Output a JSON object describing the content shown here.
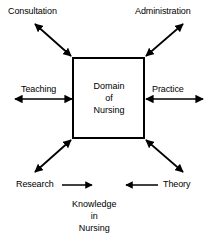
{
  "diagram": {
    "title": "Domain of Nursing",
    "type": "concept-diagram",
    "colors": {
      "stroke": "#000000",
      "background": "#ffffff",
      "text": "#000000"
    },
    "center_box": {
      "name": "domain-of-nursing-box",
      "lines": [
        "Domain",
        "of",
        "Nursing"
      ],
      "line1": "Domain",
      "line2": "of",
      "line3": "Nursing"
    },
    "bottom_node": {
      "name": "knowledge-in-nursing",
      "lines": [
        "Knowledge",
        "in",
        "Nursing"
      ],
      "line1": "Knowledge",
      "line2": "in",
      "line3": "Nursing"
    },
    "nodes": [
      {
        "id": "consultation",
        "label": "Consultation",
        "position": "top-left",
        "connector": "double-headed-diagonal-arrow"
      },
      {
        "id": "administration",
        "label": "Administration",
        "position": "top-right",
        "connector": "double-headed-diagonal-arrow"
      },
      {
        "id": "teaching",
        "label": "Teaching",
        "position": "left",
        "connector": "double-headed-horizontal-arrow"
      },
      {
        "id": "practice",
        "label": "Practice",
        "position": "right",
        "connector": "double-headed-horizontal-arrow"
      },
      {
        "id": "research",
        "label": "Research",
        "position": "bottom-left",
        "connector": "double-headed-diagonal-arrow-and-single-right-arrow"
      },
      {
        "id": "theory",
        "label": "Theory",
        "position": "bottom-right",
        "connector": "double-headed-diagonal-arrow-and-single-left-arrow"
      }
    ]
  }
}
